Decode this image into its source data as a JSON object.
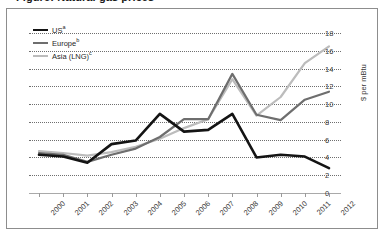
{
  "title": "Figure: Natural gas prices",
  "axis": {
    "y_label": "$ per mBtu",
    "y_ticks": [
      "0",
      "2",
      "4",
      "6",
      "8",
      "10",
      "12",
      "14",
      "16",
      "18"
    ]
  },
  "legend": {
    "items": [
      {
        "label": "US",
        "note": "a",
        "color": "#141414",
        "width": 2.6
      },
      {
        "label": "Europe",
        "note": "b",
        "color": "#6e6e6e",
        "width": 2.4
      },
      {
        "label": "Asia (LNG)",
        "note": "c",
        "color": "#bcbcbc",
        "width": 2.4
      }
    ]
  },
  "chart_data": {
    "type": "line",
    "title": "Natural gas prices",
    "xlabel": "",
    "ylabel": "$ per mBtu",
    "ylim": [
      0,
      18
    ],
    "ytick_step": 2,
    "grid": true,
    "legend_position": "top-left",
    "categories": [
      "2000",
      "2001",
      "2002",
      "2003",
      "2004",
      "2005",
      "2006",
      "2007",
      "2008",
      "2009",
      "2010",
      "2011",
      "2012"
    ],
    "series": [
      {
        "name": "US",
        "note": "a",
        "color": "#141414",
        "values": [
          4.3,
          4.1,
          3.4,
          5.5,
          5.9,
          8.9,
          6.9,
          7.1,
          8.9,
          4.0,
          4.3,
          4.1,
          2.8
        ]
      },
      {
        "name": "Europe",
        "note": "b",
        "color": "#6e6e6e",
        "values": [
          4.5,
          4.3,
          3.5,
          4.3,
          5.0,
          6.3,
          8.3,
          8.3,
          13.4,
          8.8,
          8.2,
          10.5,
          11.4
        ]
      },
      {
        "name": "Asia (LNG)",
        "note": "c",
        "color": "#bcbcbc",
        "values": [
          4.7,
          4.5,
          4.2,
          4.6,
          5.2,
          6.1,
          7.3,
          8.3,
          12.8,
          8.7,
          10.8,
          14.6,
          16.5
        ]
      }
    ]
  }
}
